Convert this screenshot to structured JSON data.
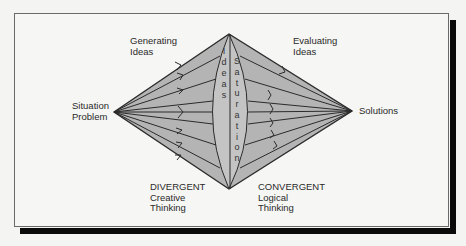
{
  "diagram": {
    "type": "divergent-convergent thinking diamond",
    "colors": {
      "background": "#f6f6f4",
      "diamond_fill": "#b4b4b4",
      "lens_fill": "#c2c2c2",
      "stroke": "#2b2b2b",
      "shadow": "#0a0a0a"
    },
    "nodes": {
      "start": {
        "line1": "Situation",
        "line2": "Problem"
      },
      "end": {
        "line1": "Solutions"
      }
    },
    "phases": {
      "generating": {
        "line1": "Generating",
        "line2": "Ideas"
      },
      "evaluating": {
        "line1": "Evaluating",
        "line2": "Ideas"
      },
      "divergent": {
        "line1": "DIVERGENT",
        "line2": "Creative",
        "line3": "Thinking"
      },
      "convergent": {
        "line1": "CONVERGENT",
        "line2": "Logical",
        "line3": "Thinking"
      }
    },
    "center": {
      "left_word": "Ideas",
      "left_letters": [
        "I",
        "d",
        "e",
        "a",
        "s"
      ],
      "right_word": "Saturation",
      "right_letters": [
        "S",
        "a",
        "t",
        "u",
        "r",
        "a",
        "t",
        "i",
        "o",
        "n"
      ]
    }
  }
}
